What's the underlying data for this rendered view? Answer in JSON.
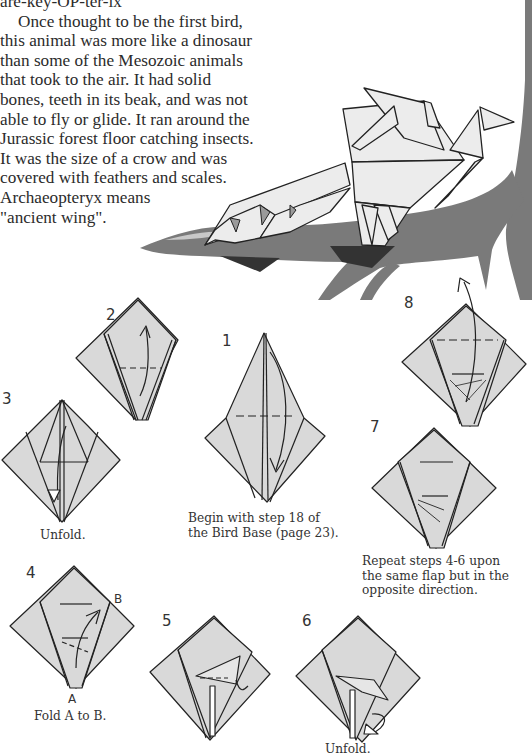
{
  "page": {
    "pronunciation": "are-key-OP-ter-ix",
    "intro_lines": [
      "Once thought to be the first bird,",
      "this animal was more like a dinosaur",
      "than some of the Mesozoic animals",
      "that took to the air.  It had solid",
      "bones, teeth in its beak, and was not",
      "able to fly or glide.  It ran around the",
      "Jurassic forest floor catching insects.",
      "It was the size of a crow and was",
      "covered with feathers and scales.",
      "Archaeopteryx means",
      "\"ancient wing\"."
    ]
  },
  "illustration": {
    "subject": "origami-archaeopteryx-on-branch",
    "colors": {
      "paper": "#e6e6e6",
      "paper_shadow": "#9a9a9a",
      "branch": "#7a7a7a",
      "branch_dark": "#3a3a3a",
      "line": "#222222"
    }
  },
  "steps": [
    {
      "number": "1",
      "caption_lines": [
        "Begin with step 18 of",
        "the Bird Base (page 23)."
      ]
    },
    {
      "number": "2",
      "caption_lines": []
    },
    {
      "number": "3",
      "caption_lines": [
        "Unfold."
      ]
    },
    {
      "number": "4",
      "caption_lines": [
        "Fold A to B."
      ],
      "point_labels": [
        "A",
        "B"
      ]
    },
    {
      "number": "5",
      "caption_lines": []
    },
    {
      "number": "6",
      "caption_lines": [
        "Unfold."
      ]
    },
    {
      "number": "7",
      "caption_lines": [
        "Repeat steps 4-6 upon",
        "the same flap but in the",
        "opposite direction."
      ]
    },
    {
      "number": "8",
      "caption_lines": []
    }
  ]
}
